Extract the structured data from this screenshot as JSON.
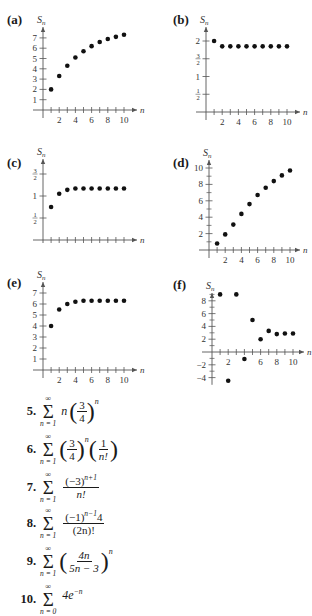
{
  "chart_data": [
    {
      "id": "a",
      "label": "(a)",
      "type": "scatter",
      "ylabel": "S_n",
      "xlabel": "n",
      "x": [
        1,
        2,
        3,
        4,
        5,
        6,
        7,
        8,
        9,
        10
      ],
      "values": [
        2,
        3.3,
        4.3,
        5.1,
        5.7,
        6.2,
        6.6,
        6.9,
        7.1,
        7.3
      ],
      "xticks": [
        "2",
        "4",
        "6",
        "8",
        "10"
      ],
      "yticks": [
        "1",
        "2",
        "3",
        "4",
        "5",
        "6",
        "7"
      ],
      "ylim": [
        0,
        7.5
      ],
      "xlim": [
        0,
        10.5
      ],
      "grid": false
    },
    {
      "id": "b",
      "label": "(b)",
      "type": "scatter",
      "ylabel": "S_n",
      "xlabel": "n",
      "x": [
        1,
        2,
        3,
        4,
        5,
        6,
        7,
        8,
        9,
        10
      ],
      "values": [
        2,
        1.85,
        1.85,
        1.85,
        1.85,
        1.85,
        1.85,
        1.85,
        1.85,
        1.85
      ],
      "xticks": [
        "2",
        "4",
        "6",
        "8",
        "10"
      ],
      "yticks": [
        "1/2",
        "1",
        "3/2",
        "2"
      ],
      "ylim": [
        0,
        2.2
      ],
      "xlim": [
        0,
        10.5
      ],
      "grid": false
    },
    {
      "id": "c",
      "label": "(c)",
      "type": "scatter",
      "ylabel": "S_n",
      "xlabel": "n",
      "x": [
        1,
        2,
        3,
        4,
        5,
        6,
        7,
        8,
        9,
        10
      ],
      "values": [
        0.75,
        1.05,
        1.14,
        1.17,
        1.17,
        1.17,
        1.17,
        1.17,
        1.17,
        1.17
      ],
      "xticks": [
        "2",
        "4",
        "6",
        "8",
        "10"
      ],
      "yticks": [
        "1/2",
        "1",
        "3/2"
      ],
      "ylim": [
        0,
        1.7
      ],
      "xlim": [
        0,
        10.5
      ],
      "grid": false
    },
    {
      "id": "d",
      "label": "(d)",
      "type": "scatter",
      "ylabel": "S_n",
      "xlabel": "n",
      "x": [
        1,
        2,
        3,
        4,
        5,
        6,
        7,
        8,
        9,
        10
      ],
      "values": [
        0.8,
        1.9,
        3.1,
        4.4,
        5.6,
        6.7,
        7.6,
        8.4,
        9.1,
        9.7
      ],
      "xticks": [
        "2",
        "4",
        "6",
        "8",
        "10"
      ],
      "yticks": [
        "2",
        "4",
        "6",
        "8",
        "10"
      ],
      "ylim": [
        0,
        10.5
      ],
      "xlim": [
        0,
        10.5
      ],
      "grid": false
    },
    {
      "id": "e",
      "label": "(e)",
      "type": "scatter",
      "ylabel": "S_n",
      "xlabel": "n",
      "x": [
        1,
        2,
        3,
        4,
        5,
        6,
        7,
        8,
        9,
        10
      ],
      "values": [
        4,
        5.5,
        6.0,
        6.2,
        6.3,
        6.3,
        6.3,
        6.3,
        6.3,
        6.3
      ],
      "xticks": [
        "2",
        "4",
        "6",
        "8",
        "10"
      ],
      "yticks": [
        "1",
        "2",
        "3",
        "4",
        "5",
        "6",
        "7"
      ],
      "ylim": [
        0,
        7.5
      ],
      "xlim": [
        0,
        10.5
      ],
      "grid": false
    },
    {
      "id": "f",
      "label": "(f)",
      "type": "scatter",
      "ylabel": "S_n",
      "xlabel": "n",
      "x": [
        1,
        2,
        3,
        4,
        5,
        6,
        7,
        8,
        9,
        10
      ],
      "values": [
        9,
        -4.5,
        9,
        -1.1,
        5,
        2,
        3.3,
        2.8,
        2.9,
        2.9
      ],
      "xticks": [
        "2",
        "6",
        "8",
        "10"
      ],
      "yticks": [
        "-4",
        "-2",
        "2",
        "4",
        "6",
        "8"
      ],
      "ylim": [
        -4.5,
        9.5
      ],
      "xlim": [
        0,
        10.5
      ],
      "grid": false
    }
  ],
  "panels": {
    "a": {
      "label": "(a)",
      "ylabel": "S",
      "ysub": "n",
      "xlabel": "n"
    },
    "b": {
      "label": "(b)",
      "ylabel": "S",
      "ysub": "n",
      "xlabel": "n"
    },
    "c": {
      "label": "(c)",
      "ylabel": "S",
      "ysub": "n",
      "xlabel": "n"
    },
    "d": {
      "label": "(d)",
      "ylabel": "S",
      "ysub": "n",
      "xlabel": "n"
    },
    "e": {
      "label": "(e)",
      "ylabel": "S",
      "ysub": "n",
      "xlabel": "n"
    },
    "f": {
      "label": "(f)",
      "ylabel": "S",
      "ysub": "n",
      "xlabel": "n"
    }
  },
  "exercises": [
    {
      "number": "5.",
      "upper": "∞",
      "lower": "n = 1",
      "expression": "n (3/4)^n",
      "coef": "n",
      "frac_num": "3",
      "frac_den": "4",
      "exp": "n"
    },
    {
      "number": "6.",
      "upper": "∞",
      "lower": "n = 1",
      "expression": "(3/4)^n (1/n!)",
      "frac1_num": "3",
      "frac1_den": "4",
      "exp": "n",
      "frac2_num": "1",
      "frac2_den": "n!"
    },
    {
      "number": "7.",
      "upper": "∞",
      "lower": "n = 1",
      "expression": "(−3)^(n+1) / n!",
      "num": "(−3)",
      "num_exp": "n+1",
      "den": "n!"
    },
    {
      "number": "8.",
      "upper": "∞",
      "lower": "n = 1",
      "expression": "(−1)^(n−1) 4 / (2n)!",
      "num": "(−1)",
      "num_exp": "n−1",
      "num_tail": "4",
      "den": "(2n)!"
    },
    {
      "number": "9.",
      "upper": "∞",
      "lower": "n = 1",
      "expression": "(4n/(5n − 3))^n",
      "frac_num": "4n",
      "frac_den": "5n − 3",
      "exp": "n"
    },
    {
      "number": "10.",
      "upper": "∞",
      "lower": "n = 0",
      "expression": "4e^(−n)",
      "base": "4e",
      "exp": "−n"
    }
  ]
}
